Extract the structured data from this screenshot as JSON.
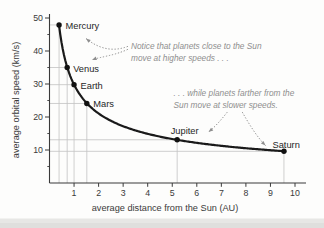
{
  "figure": {
    "background": "#fdfdfc",
    "bottom_band_color": "#e3e3e0"
  },
  "chart_data": {
    "type": "scatter",
    "title": "",
    "xlabel": "average distance from the Sun (AU)",
    "ylabel": "average orbital speed (km/s)",
    "xlim": [
      0,
      10.4
    ],
    "ylim": [
      0,
      51
    ],
    "x_ticks": [
      1,
      2,
      3,
      4,
      5,
      6,
      7,
      8,
      9,
      10
    ],
    "y_ticks": [
      10,
      20,
      30,
      40,
      50
    ],
    "y_minor_ticks": [
      5,
      15,
      25,
      35,
      45
    ],
    "grid": "thin gray guide lines from each planet point to both axes",
    "legend": "none",
    "series": [
      {
        "name": "planets",
        "points": [
          {
            "label": "Mercury",
            "x": 0.39,
            "y": 47.9
          },
          {
            "label": "Venus",
            "x": 0.72,
            "y": 35.0
          },
          {
            "label": "Earth",
            "x": 1.0,
            "y": 29.8
          },
          {
            "label": "Mars",
            "x": 1.52,
            "y": 24.1
          },
          {
            "label": "Jupiter",
            "x": 5.2,
            "y": 13.1
          },
          {
            "label": "Saturn",
            "x": 9.55,
            "y": 9.6
          }
        ]
      }
    ],
    "curve": {
      "formula": "v = 29.8 / sqrt(d)",
      "domain": [
        0.385,
        9.6
      ]
    },
    "annotations": [
      {
        "id": "note-close",
        "lines": [
          "Notice that planets close to the Sun",
          "move at higher speeds . . ."
        ],
        "targets": [
          "Mercury",
          "Venus"
        ]
      },
      {
        "id": "note-far",
        "lines": [
          ". . . while planets farther from the",
          "Sun move at slower speeds."
        ],
        "targets": [
          "Jupiter",
          "Saturn"
        ]
      }
    ],
    "colors": {
      "curve": "#1a1a1a",
      "point": "#111111",
      "axis": "#3a3a3a",
      "grid": "#c3c3c3",
      "tick_label": "#3a3a3a",
      "planet_label": "#262626",
      "annotation": "#8f8f8f"
    }
  }
}
